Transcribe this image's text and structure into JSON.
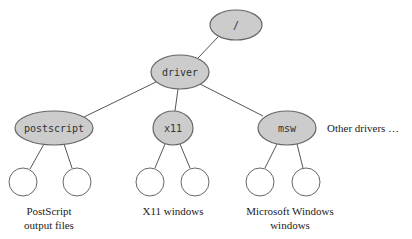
{
  "diagram": {
    "root": {
      "label": "/"
    },
    "driver": {
      "label": "driver"
    },
    "children": [
      {
        "label": "postscript",
        "caption_line1": "PostScript",
        "caption_line2": "output files"
      },
      {
        "label": "x11",
        "caption_line1": "X11 windows",
        "caption_line2": ""
      },
      {
        "label": "msw",
        "caption_line1": "Microsoft Windows",
        "caption_line2": "windows"
      }
    ],
    "other_label": "Other drivers …",
    "colors": {
      "node_fill": "#cccccc",
      "node_stroke": "#666666",
      "leaf_fill": "#ffffff"
    }
  }
}
